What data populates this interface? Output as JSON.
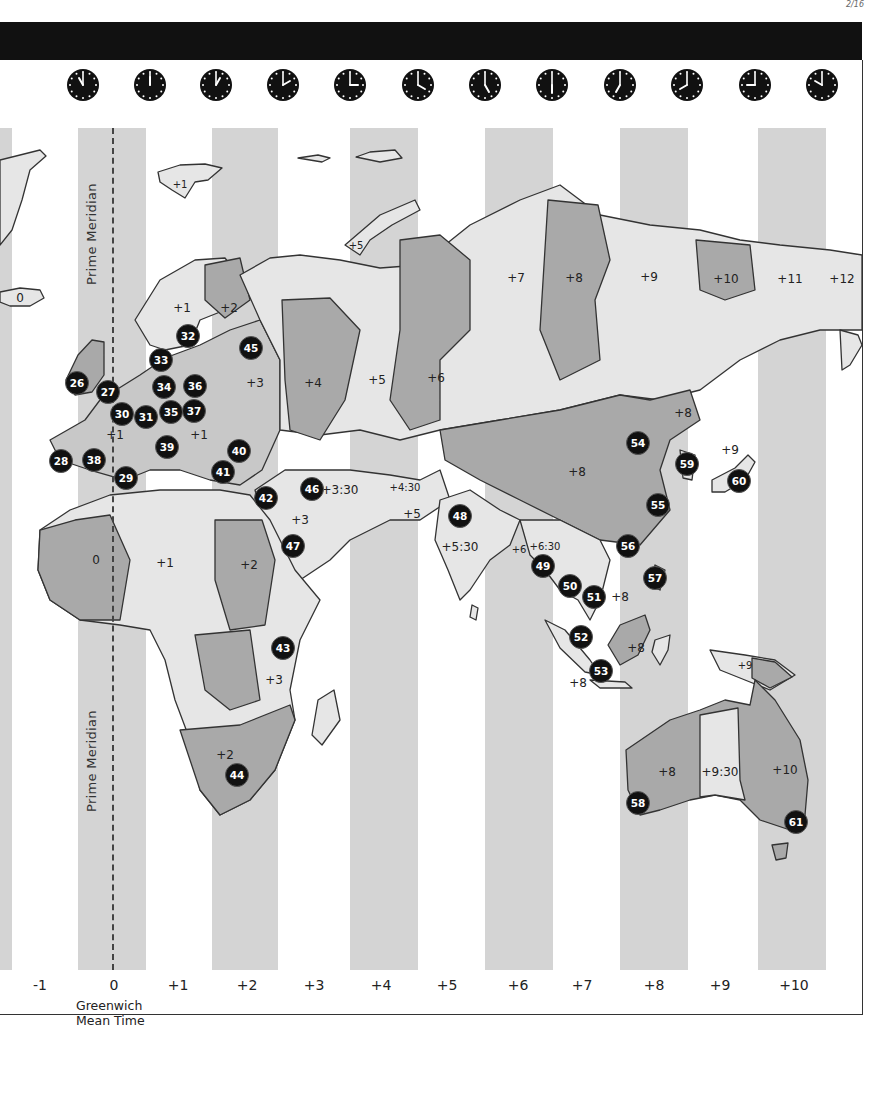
{
  "page": {
    "corner_mark": "2/16",
    "title_bar": ""
  },
  "clocks": [
    {
      "x": 83,
      "hour": 11
    },
    {
      "x": 150,
      "hour": 12
    },
    {
      "x": 216,
      "hour": 1
    },
    {
      "x": 283,
      "hour": 2
    },
    {
      "x": 350,
      "hour": 3
    },
    {
      "x": 418,
      "hour": 4
    },
    {
      "x": 485,
      "hour": 5
    },
    {
      "x": 552,
      "hour": 6
    },
    {
      "x": 620,
      "hour": 7
    },
    {
      "x": 687,
      "hour": 8
    },
    {
      "x": 755,
      "hour": 9
    },
    {
      "x": 822,
      "hour": 10
    }
  ],
  "bands": [
    {
      "x": 0,
      "w": 12
    },
    {
      "x": 78,
      "w": 68
    },
    {
      "x": 212,
      "w": 66
    },
    {
      "x": 350,
      "w": 68
    },
    {
      "x": 485,
      "w": 68
    },
    {
      "x": 620,
      "w": 68
    },
    {
      "x": 758,
      "w": 68
    }
  ],
  "prime_meridian": {
    "label_top": "Prime Meridian",
    "label_bottom": "Prime Meridian"
  },
  "axis": {
    "ticks": [
      {
        "x": 40,
        "label": "-1"
      },
      {
        "x": 114,
        "label": "0"
      },
      {
        "x": 178,
        "label": "+1"
      },
      {
        "x": 247,
        "label": "+2"
      },
      {
        "x": 314,
        "label": "+3"
      },
      {
        "x": 381,
        "label": "+4"
      },
      {
        "x": 447,
        "label": "+5"
      },
      {
        "x": 518,
        "label": "+6"
      },
      {
        "x": 582,
        "label": "+7"
      },
      {
        "x": 654,
        "label": "+8"
      },
      {
        "x": 720,
        "label": "+9"
      },
      {
        "x": 794,
        "label": "+10"
      }
    ],
    "gmt_line1": "Greenwich",
    "gmt_line2": "Mean Time"
  },
  "zone_labels": [
    {
      "x": 20,
      "y": 298,
      "text": "0"
    },
    {
      "x": 180,
      "y": 184,
      "text": "+1",
      "small": true
    },
    {
      "x": 182,
      "y": 308,
      "text": "+1"
    },
    {
      "x": 229,
      "y": 308,
      "text": "+2"
    },
    {
      "x": 356,
      "y": 245,
      "text": "+5",
      "small": true
    },
    {
      "x": 255,
      "y": 383,
      "text": "+3"
    },
    {
      "x": 313,
      "y": 383,
      "text": "+4"
    },
    {
      "x": 377,
      "y": 380,
      "text": "+5"
    },
    {
      "x": 436,
      "y": 378,
      "text": "+6"
    },
    {
      "x": 516,
      "y": 278,
      "text": "+7"
    },
    {
      "x": 574,
      "y": 278,
      "text": "+8"
    },
    {
      "x": 649,
      "y": 277,
      "text": "+9"
    },
    {
      "x": 726,
      "y": 279,
      "text": "+10"
    },
    {
      "x": 790,
      "y": 279,
      "text": "+11"
    },
    {
      "x": 842,
      "y": 279,
      "text": "+12"
    },
    {
      "x": 115,
      "y": 435,
      "text": "+1"
    },
    {
      "x": 199,
      "y": 435,
      "text": "+1"
    },
    {
      "x": 340,
      "y": 490,
      "text": "+3:30"
    },
    {
      "x": 405,
      "y": 487,
      "text": "+4:30",
      "small": true
    },
    {
      "x": 412,
      "y": 514,
      "text": "+5"
    },
    {
      "x": 300,
      "y": 520,
      "text": "+3"
    },
    {
      "x": 460,
      "y": 547,
      "text": "+5:30"
    },
    {
      "x": 519,
      "y": 549,
      "text": "+6",
      "small": true
    },
    {
      "x": 545,
      "y": 546,
      "text": "+6:30",
      "small": true
    },
    {
      "x": 577,
      "y": 472,
      "text": "+8"
    },
    {
      "x": 683,
      "y": 413,
      "text": "+8"
    },
    {
      "x": 730,
      "y": 450,
      "text": "+9"
    },
    {
      "x": 620,
      "y": 597,
      "text": "+8"
    },
    {
      "x": 636,
      "y": 648,
      "text": "+8"
    },
    {
      "x": 578,
      "y": 683,
      "text": "+8"
    },
    {
      "x": 745,
      "y": 665,
      "text": "+9",
      "small": true
    },
    {
      "x": 96,
      "y": 560,
      "text": "0"
    },
    {
      "x": 165,
      "y": 563,
      "text": "+1"
    },
    {
      "x": 249,
      "y": 565,
      "text": "+2"
    },
    {
      "x": 274,
      "y": 680,
      "text": "+3"
    },
    {
      "x": 225,
      "y": 755,
      "text": "+2"
    },
    {
      "x": 667,
      "y": 772,
      "text": "+8"
    },
    {
      "x": 720,
      "y": 772,
      "text": "+9:30"
    },
    {
      "x": 785,
      "y": 770,
      "text": "+10"
    }
  ],
  "markers": [
    {
      "x": 77,
      "y": 383,
      "n": "26"
    },
    {
      "x": 108,
      "y": 392,
      "n": "27"
    },
    {
      "x": 61,
      "y": 461,
      "n": "28"
    },
    {
      "x": 126,
      "y": 478,
      "n": "29"
    },
    {
      "x": 122,
      "y": 414,
      "n": "30"
    },
    {
      "x": 146,
      "y": 417,
      "n": "31"
    },
    {
      "x": 188,
      "y": 336,
      "n": "32"
    },
    {
      "x": 161,
      "y": 360,
      "n": "33"
    },
    {
      "x": 164,
      "y": 387,
      "n": "34"
    },
    {
      "x": 171,
      "y": 412,
      "n": "35"
    },
    {
      "x": 195,
      "y": 386,
      "n": "36"
    },
    {
      "x": 194,
      "y": 411,
      "n": "37"
    },
    {
      "x": 94,
      "y": 460,
      "n": "38"
    },
    {
      "x": 167,
      "y": 447,
      "n": "39"
    },
    {
      "x": 239,
      "y": 451,
      "n": "40"
    },
    {
      "x": 223,
      "y": 472,
      "n": "41"
    },
    {
      "x": 266,
      "y": 498,
      "n": "42"
    },
    {
      "x": 283,
      "y": 648,
      "n": "43"
    },
    {
      "x": 237,
      "y": 775,
      "n": "44"
    },
    {
      "x": 251,
      "y": 348,
      "n": "45"
    },
    {
      "x": 312,
      "y": 489,
      "n": "46"
    },
    {
      "x": 293,
      "y": 546,
      "n": "47"
    },
    {
      "x": 460,
      "y": 516,
      "n": "48"
    },
    {
      "x": 543,
      "y": 566,
      "n": "49"
    },
    {
      "x": 570,
      "y": 586,
      "n": "50"
    },
    {
      "x": 594,
      "y": 597,
      "n": "51"
    },
    {
      "x": 581,
      "y": 637,
      "n": "52"
    },
    {
      "x": 601,
      "y": 671,
      "n": "53"
    },
    {
      "x": 638,
      "y": 443,
      "n": "54"
    },
    {
      "x": 658,
      "y": 505,
      "n": "55"
    },
    {
      "x": 628,
      "y": 546,
      "n": "56"
    },
    {
      "x": 655,
      "y": 578,
      "n": "57"
    },
    {
      "x": 638,
      "y": 803,
      "n": "58"
    },
    {
      "x": 687,
      "y": 464,
      "n": "59"
    },
    {
      "x": 739,
      "y": 481,
      "n": "60"
    },
    {
      "x": 796,
      "y": 822,
      "n": "61"
    }
  ],
  "colors": {
    "band": "#d4d4d4",
    "land_light": "#e6e6e6",
    "land_mid": "#c8c8c8",
    "land_dark": "#a9a9a9",
    "marker": "#111111",
    "header": "#111111"
  }
}
